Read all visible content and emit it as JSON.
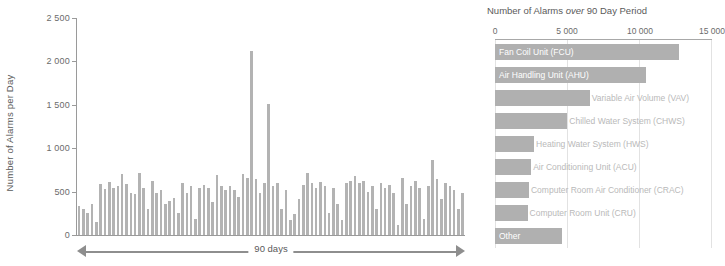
{
  "chart_data": [
    {
      "type": "bar",
      "id": "alarms-per-day",
      "title": "",
      "xlabel": "90 days",
      "ylabel": "Number of Alarms per Day",
      "ylim": [
        0,
        2500
      ],
      "yticks": [
        "0",
        "500",
        "1 000",
        "1 500",
        "2 000",
        "2 500"
      ],
      "ytick_values": [
        0,
        500,
        1000,
        1500,
        2000,
        2500
      ],
      "grid": false,
      "categories": [
        "1",
        "2",
        "3",
        "4",
        "5",
        "6",
        "7",
        "8",
        "9",
        "10",
        "11",
        "12",
        "13",
        "14",
        "15",
        "16",
        "17",
        "18",
        "19",
        "20",
        "21",
        "22",
        "23",
        "24",
        "25",
        "26",
        "27",
        "28",
        "29",
        "30",
        "31",
        "32",
        "33",
        "34",
        "35",
        "36",
        "37",
        "38",
        "39",
        "40",
        "41",
        "42",
        "43",
        "44",
        "45",
        "46",
        "47",
        "48",
        "49",
        "50",
        "51",
        "52",
        "53",
        "54",
        "55",
        "56",
        "57",
        "58",
        "59",
        "60",
        "61",
        "62",
        "63",
        "64",
        "65",
        "66",
        "67",
        "68",
        "69",
        "70",
        "71",
        "72",
        "73",
        "74",
        "75",
        "76",
        "77",
        "78",
        "79",
        "80",
        "81",
        "82",
        "83",
        "84",
        "85",
        "86",
        "87",
        "88",
        "89",
        "90"
      ],
      "values": [
        330,
        300,
        250,
        360,
        150,
        590,
        530,
        610,
        545,
        560,
        700,
        590,
        480,
        470,
        720,
        540,
        300,
        620,
        480,
        520,
        360,
        390,
        430,
        250,
        600,
        480,
        560,
        180,
        540,
        580,
        540,
        380,
        690,
        560,
        520,
        560,
        520,
        440,
        700,
        660,
        2120,
        640,
        480,
        600,
        1510,
        560,
        600,
        300,
        520,
        170,
        240,
        420,
        580,
        720,
        600,
        540,
        610,
        560,
        250,
        540,
        360,
        170,
        600,
        620,
        680,
        600,
        620,
        500,
        560,
        300,
        600,
        540,
        580,
        480,
        120,
        660,
        360,
        560,
        620,
        540,
        180,
        560,
        860,
        640,
        420,
        600,
        560,
        520,
        300,
        480
      ],
      "bar_color": "#b3b3b3"
    },
    {
      "type": "bar",
      "id": "alarms-by-equipment",
      "orientation": "horizontal",
      "title": "Number of Alarms over 90 Day Period",
      "title_italic_word": "over",
      "xlabel": "",
      "ylabel": "",
      "xlim": [
        0,
        15000
      ],
      "xticks": [
        "0",
        "5 000",
        "10 000",
        "15 000"
      ],
      "xtick_values": [
        0,
        5000,
        10000,
        15000
      ],
      "grid": true,
      "categories": [
        "Fan Coil Unit (FCU)",
        "Air Handling Unit (AHU)",
        "Variable Air Volume (VAV)",
        "Chilled Water System (CHWS)",
        "Heating Water System (HWS)",
        "Air Conditioning Unit (ACU)",
        "Computer Room Air Conditioner (CRAC)",
        "Computer Room Unit (CRU)",
        "Other"
      ],
      "values": [
        12700,
        10450,
        6550,
        5000,
        2700,
        2500,
        2350,
        2250,
        4650
      ],
      "label_placement": [
        "inside",
        "inside",
        "outside",
        "outside",
        "outside",
        "outside",
        "outside",
        "outside",
        "inside"
      ],
      "bar_color": "#b0b0b0",
      "label_color_inside": "#ffffff",
      "label_color_outside": "#b9b9b9"
    }
  ],
  "left": {
    "ylabel": "Number of Alarms per Day",
    "xlabel": "90 days",
    "yticks": [
      "2 500",
      "2 000",
      "1 500",
      "1 000",
      "500",
      "0"
    ]
  },
  "right": {
    "title_pre": "Number of Alarms ",
    "title_em": "over",
    "title_post": " 90 Day Period",
    "xticks": [
      "0",
      "5 000",
      "10 000",
      "15 000"
    ]
  }
}
